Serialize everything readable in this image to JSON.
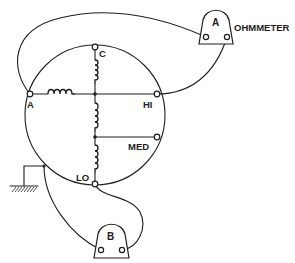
{
  "diagram": {
    "motor": {
      "terminals": {
        "a": "A",
        "c": "C",
        "hi": "HI",
        "med": "MED",
        "lo": "LO"
      }
    },
    "ohmmeter_a": {
      "label": "A",
      "title": "OHMMETER"
    },
    "ohmmeter_b": {
      "label": "B"
    },
    "colors": {
      "line": "#1e1e1e",
      "background": "#ffffff"
    }
  }
}
